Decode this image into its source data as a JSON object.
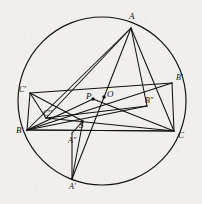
{
  "figure": {
    "title": "Circumscribed triangle with cevians and isogonal conjugate points",
    "background_color": "#f0efeb",
    "stroke_color": "#111111",
    "canvas": {
      "width": 202,
      "height": 204
    },
    "circle": {
      "label": "circumcircle",
      "cx": 102,
      "cy": 101,
      "r": 84
    },
    "points": [
      {
        "id": "A",
        "label": "A",
        "x": 131,
        "y": 28,
        "on_circle": true,
        "label_dx": -2,
        "label_dy": -11,
        "dot": false
      },
      {
        "id": "B",
        "label": "B",
        "x": 27,
        "y": 130,
        "on_circle": true,
        "label_dx": -11,
        "label_dy": 1,
        "dot": false
      },
      {
        "id": "C",
        "label": "C",
        "x": 174,
        "y": 131,
        "on_circle": true,
        "label_dx": 4,
        "label_dy": 5,
        "dot": false
      },
      {
        "id": "Aprime",
        "label": "A'",
        "x": 72,
        "y": 179,
        "on_circle": true,
        "label_dx": -3,
        "label_dy": 9,
        "dot": false
      },
      {
        "id": "Bprime",
        "label": "B'",
        "x": 172,
        "y": 83,
        "on_circle": true,
        "label_dx": 4,
        "label_dy": -4,
        "dot": false
      },
      {
        "id": "Cprime",
        "label": "C'",
        "x": 30,
        "y": 93,
        "on_circle": true,
        "label_dx": -11,
        "label_dy": -2,
        "dot": false
      },
      {
        "id": "Adbl",
        "label": "A''",
        "x": 72,
        "y": 133,
        "on_circle": false,
        "label_dx": -4,
        "label_dy": 9,
        "dot": false
      },
      {
        "id": "Bdbl",
        "label": "B''",
        "x": 147,
        "y": 106,
        "on_circle": false,
        "label_dx": -2,
        "label_dy": -4,
        "dot": false
      },
      {
        "id": "Cdbl",
        "label": "C''",
        "x": 46,
        "y": 118,
        "on_circle": false,
        "label_dx": -3,
        "label_dy": -3,
        "dot": false
      },
      {
        "id": "P",
        "label": "P",
        "x": 93,
        "y": 99,
        "on_circle": false,
        "label_dx": -7,
        "label_dy": -2,
        "dot": true
      },
      {
        "id": "O",
        "label": "O",
        "x": 104,
        "y": 97,
        "on_circle": false,
        "label_dx": 3,
        "label_dy": -2,
        "dot": true
      },
      {
        "id": "S",
        "label": "S",
        "x": 83,
        "y": 121,
        "on_circle": false,
        "label_dx": -4,
        "label_dy": 5,
        "dot": false
      }
    ],
    "segments": [
      {
        "name": "side-AB",
        "from": "A",
        "to": "B"
      },
      {
        "name": "side-AC",
        "from": "A",
        "to": "C"
      },
      {
        "name": "side-BC",
        "from": "B",
        "to": "C"
      },
      {
        "name": "cevian-A-Aprime",
        "from": "A",
        "to": "Aprime"
      },
      {
        "name": "cevian-A-Cdbl",
        "from": "A",
        "to": "Cdbl"
      },
      {
        "name": "chord-A-Bdbl",
        "from": "A",
        "to": "Bdbl"
      },
      {
        "name": "chord-Cprime-B",
        "from": "Cprime",
        "to": "B"
      },
      {
        "name": "chord-Cprime-Bprime",
        "from": "Cprime",
        "to": "Bprime"
      },
      {
        "name": "chord-Cprime-Cdbl",
        "from": "Cprime",
        "to": "Cdbl"
      },
      {
        "name": "chord-Cprime-S",
        "from": "Cprime",
        "to": "S"
      },
      {
        "name": "chord-Bprime-B",
        "from": "Bprime",
        "to": "B"
      },
      {
        "name": "chord-Bprime-C",
        "from": "Bprime",
        "to": "C"
      },
      {
        "name": "chord-Aprime-S",
        "from": "Aprime",
        "to": "S"
      },
      {
        "name": "chord-B-Bdbl",
        "from": "B",
        "to": "Bdbl"
      },
      {
        "name": "chord-B-C-lower",
        "from": "B",
        "to": "C"
      },
      {
        "name": "chord-Cdbl-C",
        "from": "Cdbl",
        "to": "C"
      },
      {
        "name": "chord-Cdbl-Bdbl",
        "from": "Cdbl",
        "to": "Bdbl"
      },
      {
        "name": "altitude-Adbl-Aprime",
        "from": "Adbl",
        "to": "Aprime"
      },
      {
        "name": "perp-Adbl-S",
        "from": "Adbl",
        "to": "S"
      },
      {
        "name": "cevian-C-P",
        "from": "C",
        "to": "P"
      },
      {
        "name": "cevian-B-P",
        "from": "B",
        "to": "P"
      }
    ]
  }
}
